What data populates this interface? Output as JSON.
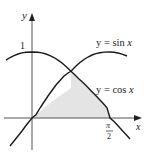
{
  "diagram": {
    "type": "area_between_curves",
    "axes": {
      "x_label": "x",
      "y_label": "y",
      "y_tick_label": "1",
      "x_tick_label_num": "π",
      "x_tick_label_den": "2"
    },
    "curves": [
      {
        "name": "sin",
        "label_prefix": "y = ",
        "label_fn": "sin ",
        "label_var": "x"
      },
      {
        "name": "cos",
        "label_prefix": "y = ",
        "label_fn": "cos ",
        "label_var": "x"
      }
    ],
    "shaded_region": {
      "description": "Region bounded by y = sin x, y = cos x, and the x-axis from 0 to π/2",
      "fill": "#e4e4e4"
    },
    "colors": {
      "curve": "#1a1a1a",
      "axis": "#555555",
      "shade": "#e4e4e4"
    }
  }
}
